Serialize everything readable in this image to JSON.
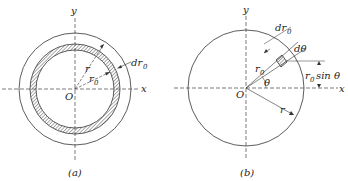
{
  "figure_a": {
    "caption": "(a)",
    "axis_x": "x",
    "axis_y": "y",
    "origin": "O",
    "label_r": "r",
    "label_r0": "r",
    "label_r0_sub": "0",
    "label_dr0": "dr",
    "label_dr0_sub": "0"
  },
  "figure_b": {
    "caption": "(b)",
    "axis_x": "x",
    "axis_y": "y",
    "origin": "O",
    "label_r": "r",
    "label_r0": "r",
    "label_r0_sub": "0",
    "label_dr0": "dr",
    "label_dr0_sub": "0",
    "label_dtheta": "dθ",
    "label_theta": "θ",
    "label_r0sin": "r",
    "label_r0sin_sub": "0",
    "label_r0sin_rest": "sin θ"
  },
  "colors": {
    "stroke": "#333333",
    "hatch": "#555555"
  }
}
